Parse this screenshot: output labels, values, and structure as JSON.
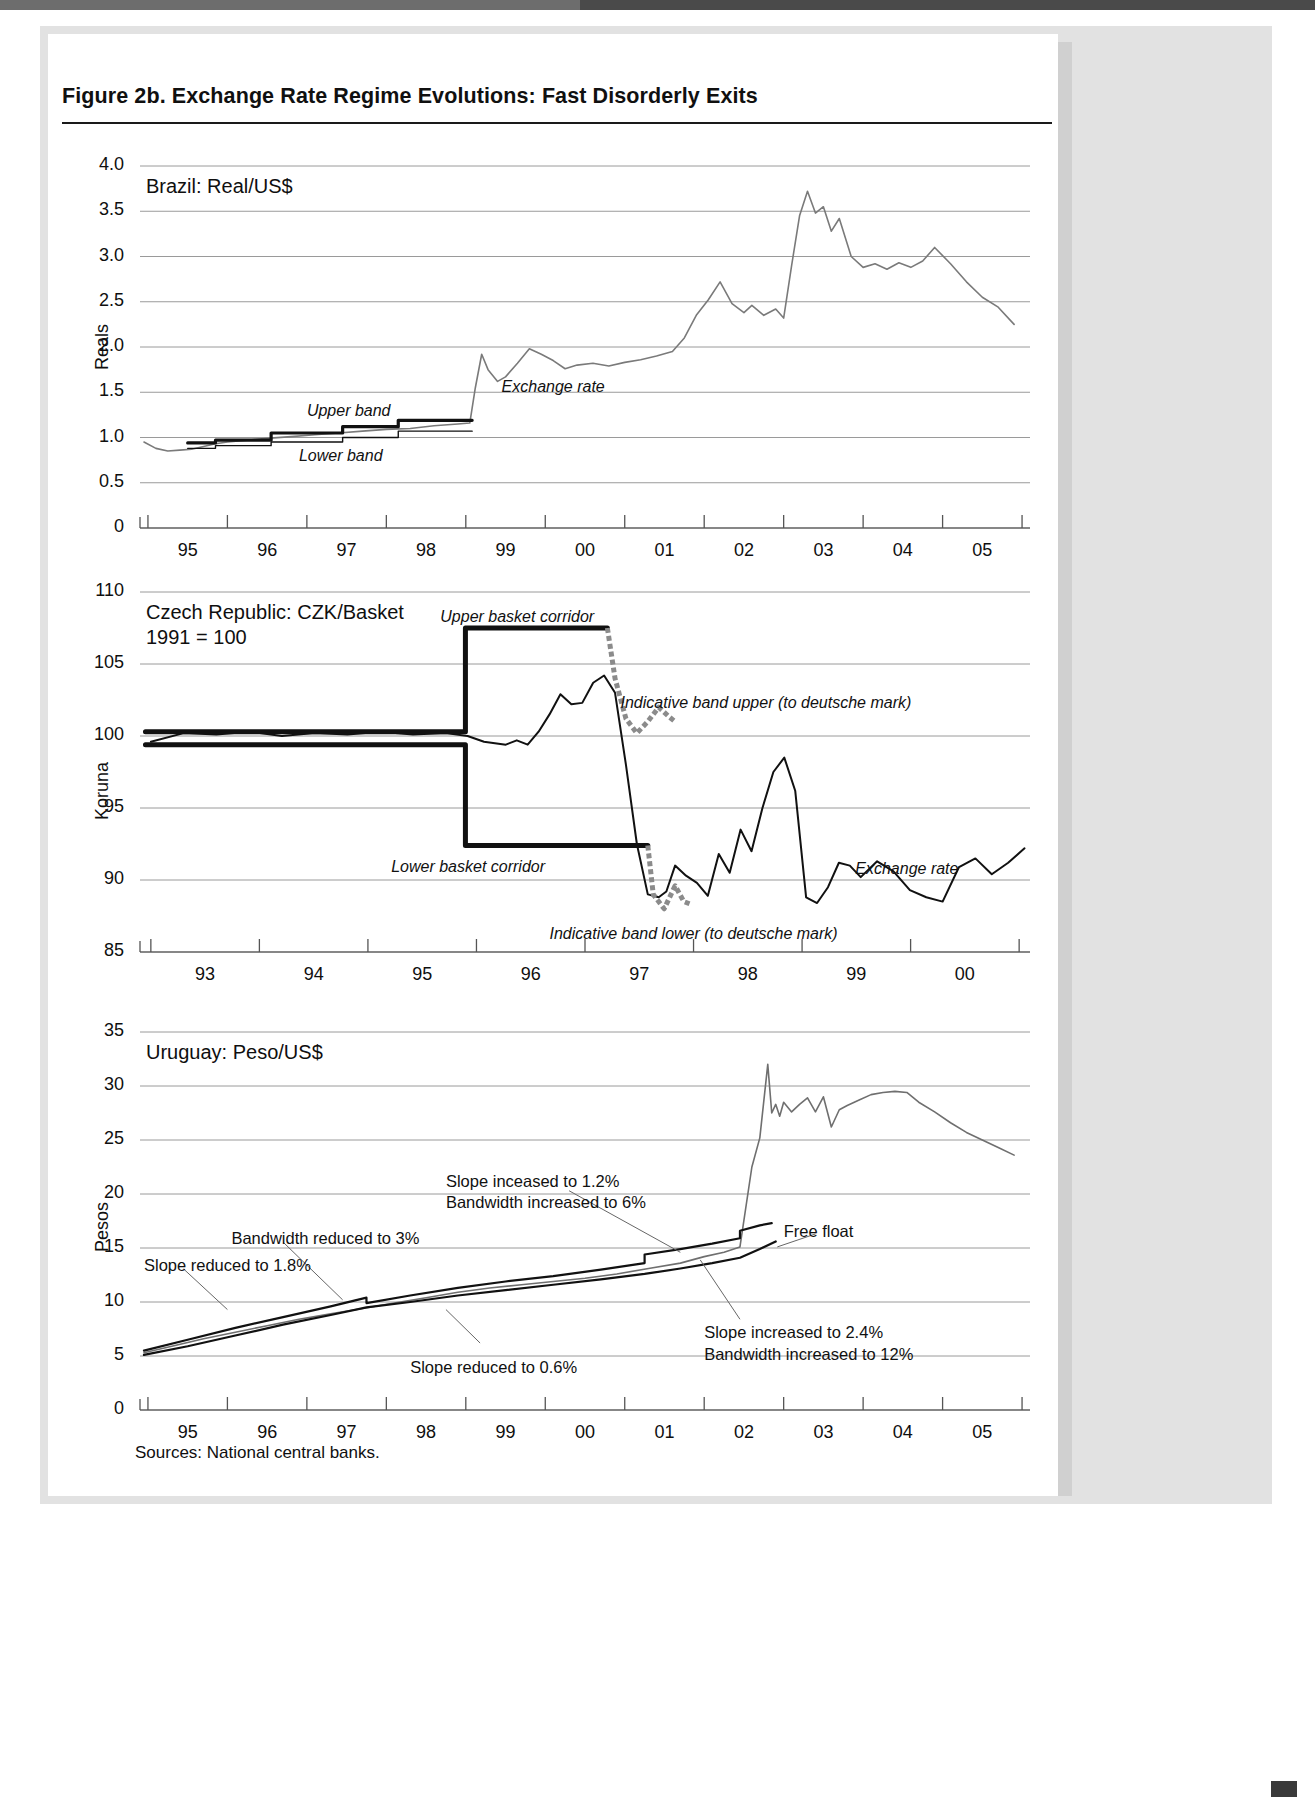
{
  "figure": {
    "title": "Figure 2b.  Exchange Rate Regime Evolutions: Fast Disorderly Exits",
    "sources": "Sources: National central banks."
  },
  "chart_data": [
    {
      "type": "line",
      "title": "Brazil: Real/US$",
      "ylabel": "Reals",
      "xlabel": "",
      "ylim": [
        0,
        4.0
      ],
      "yticks": [
        "0",
        "0.5",
        "1.0",
        "1.5",
        "2.0",
        "2.5",
        "3.0",
        "3.5",
        "4.0"
      ],
      "ytick_values": [
        0,
        0.5,
        1.0,
        1.5,
        2.0,
        2.5,
        3.0,
        3.5,
        4.0
      ],
      "xticks": [
        "95",
        "96",
        "97",
        "98",
        "99",
        "00",
        "01",
        "02",
        "03",
        "04",
        "05"
      ],
      "xlim": [
        1994.4,
        2005.6
      ],
      "grid": true,
      "annotations": [
        {
          "text": "Exchange rate",
          "x": 1998.95,
          "y": 1.55
        },
        {
          "text": "Upper band",
          "x": 1996.5,
          "y": 1.28
        },
        {
          "text": "Lower band",
          "x": 1996.4,
          "y": 0.78
        }
      ],
      "series": [
        {
          "name": "Exchange rate",
          "color": "#7a7a7a",
          "x": [
            1994.45,
            1994.6,
            1994.75,
            1994.9,
            1995.05,
            1995.2,
            1995.35,
            1995.5,
            1995.75,
            1996.0,
            1996.3,
            1996.6,
            1996.9,
            1997.2,
            1997.5,
            1997.8,
            1998.1,
            1998.4,
            1998.55,
            1998.62,
            1998.7,
            1998.78,
            1998.9,
            1999.0,
            1999.15,
            1999.3,
            1999.45,
            1999.6,
            1999.75,
            1999.9,
            2000.1,
            2000.3,
            2000.5,
            2000.7,
            2000.9,
            2001.1,
            2001.25,
            2001.4,
            2001.55,
            2001.7,
            2001.85,
            2002.0,
            2002.1,
            2002.25,
            2002.4,
            2002.5,
            2002.6,
            2002.7,
            2002.8,
            2002.9,
            2003.0,
            2003.1,
            2003.2,
            2003.35,
            2003.5,
            2003.65,
            2003.8,
            2003.95,
            2004.1,
            2004.25,
            2004.4,
            2004.6,
            2004.8,
            2005.0,
            2005.2,
            2005.4
          ],
          "y": [
            0.95,
            0.88,
            0.85,
            0.86,
            0.87,
            0.9,
            0.93,
            0.95,
            0.97,
            0.99,
            1.01,
            1.03,
            1.05,
            1.07,
            1.09,
            1.1,
            1.13,
            1.15,
            1.16,
            1.55,
            1.92,
            1.75,
            1.62,
            1.67,
            1.82,
            1.98,
            1.92,
            1.85,
            1.76,
            1.8,
            1.82,
            1.79,
            1.83,
            1.86,
            1.9,
            1.95,
            2.1,
            2.35,
            2.52,
            2.72,
            2.48,
            2.38,
            2.46,
            2.35,
            2.42,
            2.32,
            2.9,
            3.45,
            3.72,
            3.48,
            3.55,
            3.28,
            3.42,
            3.0,
            2.88,
            2.92,
            2.86,
            2.93,
            2.88,
            2.95,
            3.1,
            2.92,
            2.72,
            2.55,
            2.44,
            2.25
          ]
        },
        {
          "name": "Upper band",
          "color": "#111111",
          "width": 3.2,
          "x": [
            1995.0,
            1995.35,
            1995.35,
            1996.05,
            1996.05,
            1996.95,
            1996.95,
            1997.65,
            1997.65,
            1998.58
          ],
          "y": [
            0.94,
            0.94,
            0.97,
            0.97,
            1.05,
            1.05,
            1.12,
            1.12,
            1.19,
            1.19
          ]
        },
        {
          "name": "Lower band",
          "color": "#111111",
          "width": 1.4,
          "x": [
            1995.0,
            1995.35,
            1995.35,
            1996.05,
            1996.05,
            1996.95,
            1996.95,
            1997.65,
            1997.65,
            1998.58
          ],
          "y": [
            0.88,
            0.88,
            0.91,
            0.91,
            0.95,
            0.95,
            1.0,
            1.0,
            1.07,
            1.07
          ]
        }
      ]
    },
    {
      "type": "line",
      "title": "Czech Republic: CZK/Basket\n1991 = 100",
      "ylabel": "Koruna",
      "xlabel": "",
      "ylim": [
        85,
        110
      ],
      "yticks": [
        "85",
        "90",
        "95",
        "100",
        "105",
        "110"
      ],
      "ytick_values": [
        85,
        90,
        95,
        100,
        105,
        110
      ],
      "xticks": [
        "93",
        "94",
        "95",
        "96",
        "97",
        "98",
        "99",
        "00"
      ],
      "xlim": [
        1992.6,
        2000.75
      ],
      "grid": true,
      "annotations": [
        {
          "text": "Upper basket corridor",
          "x": 1995.35,
          "y": 108.2
        },
        {
          "text": "Lower basket corridor",
          "x": 1994.9,
          "y": 90.8
        },
        {
          "text": "Indicative band upper (to deutsche mark)",
          "x": 1997.0,
          "y": 102.2
        },
        {
          "text": "Indicative band lower (to deutsche mark)",
          "x": 1996.35,
          "y": 86.2
        },
        {
          "text": "Exchange rate",
          "x": 1999.15,
          "y": 90.7
        }
      ],
      "series": [
        {
          "name": "Exchange rate",
          "color": "#111111",
          "width": 2.0,
          "x": [
            1992.7,
            1993.0,
            1993.3,
            1993.6,
            1993.9,
            1994.2,
            1994.5,
            1994.8,
            1995.1,
            1995.4,
            1995.6,
            1995.75,
            1995.85,
            1995.95,
            1996.05,
            1996.15,
            1996.25,
            1996.35,
            1996.45,
            1996.55,
            1996.65,
            1996.75,
            1996.85,
            1996.95,
            1997.05,
            1997.15,
            1997.25,
            1997.35,
            1997.42,
            1997.5,
            1997.6,
            1997.7,
            1997.8,
            1997.9,
            1998.0,
            1998.1,
            1998.2,
            1998.3,
            1998.4,
            1998.5,
            1998.6,
            1998.7,
            1998.8,
            1998.9,
            1999.0,
            1999.1,
            1999.2,
            1999.35,
            1999.5,
            1999.65,
            1999.8,
            1999.95,
            2000.1,
            2000.25,
            2000.4,
            2000.55,
            2000.7
          ],
          "y": [
            99.6,
            100.2,
            100.1,
            100.3,
            100.0,
            100.2,
            100.1,
            100.3,
            100.1,
            100.2,
            100.0,
            99.6,
            99.5,
            99.4,
            99.7,
            99.4,
            100.3,
            101.5,
            102.9,
            102.2,
            102.3,
            103.7,
            104.2,
            103.0,
            98.0,
            92.5,
            89.0,
            88.8,
            89.2,
            91.0,
            90.3,
            89.8,
            88.9,
            91.8,
            90.5,
            93.5,
            92.0,
            95.0,
            97.5,
            98.5,
            96.2,
            88.8,
            88.4,
            89.5,
            91.2,
            91.0,
            90.2,
            91.3,
            90.6,
            89.3,
            88.8,
            88.5,
            90.9,
            91.5,
            90.4,
            91.2,
            92.2
          ]
        },
        {
          "name": "Upper basket corridor",
          "color": "#111111",
          "width": 5,
          "x": [
            1992.65,
            1995.58,
            1995.58,
            1996.88
          ],
          "y": [
            100.3,
            100.3,
            107.5,
            107.5
          ]
        },
        {
          "name": "Lower basket corridor",
          "color": "#111111",
          "width": 5,
          "x": [
            1992.65,
            1995.58,
            1995.58,
            1997.25
          ],
          "y": [
            99.4,
            99.4,
            92.4,
            92.4
          ]
        },
        {
          "name": "Indicative band upper (to deutsche mark)",
          "color": "#8b8b8b",
          "width": 5,
          "dashed": true,
          "x": [
            1996.88,
            1996.95,
            1997.05,
            1997.15,
            1997.25,
            1997.35,
            1997.45,
            1997.5
          ],
          "y": [
            107.5,
            104.0,
            101.2,
            100.2,
            101.0,
            102.0,
            101.3,
            101.0
          ]
        },
        {
          "name": "Indicative band lower (to deutsche mark)",
          "color": "#8b8b8b",
          "width": 5,
          "dashed": true,
          "x": [
            1997.25,
            1997.3,
            1997.4,
            1997.5,
            1997.58,
            1997.65
          ],
          "y": [
            92.4,
            89.0,
            88.0,
            89.6,
            88.5,
            88.3
          ]
        }
      ]
    },
    {
      "type": "line",
      "title": "Uruguay: Peso/US$",
      "ylabel": "Pesos",
      "xlabel": "",
      "ylim": [
        0,
        35
      ],
      "yticks": [
        "0",
        "5",
        "10",
        "15",
        "20",
        "25",
        "30",
        "35"
      ],
      "ytick_values": [
        0,
        5,
        10,
        15,
        20,
        25,
        30,
        35
      ],
      "xticks": [
        "95",
        "96",
        "97",
        "98",
        "99",
        "00",
        "01",
        "02",
        "03",
        "04",
        "05"
      ],
      "xlim": [
        1994.4,
        2005.6
      ],
      "grid": true,
      "annotations": [
        {
          "text": "Slope inceased to 1.2%\nBandwidth increased to 6%",
          "x": 1998.25,
          "y": 21.2
        },
        {
          "text": "Bandwidth reduced to 3%",
          "x": 1995.55,
          "y": 15.9
        },
        {
          "text": "Slope reduced to 1.8%",
          "x": 1994.45,
          "y": 13.4
        },
        {
          "text": "Slope reduced to 0.6%",
          "x": 1997.8,
          "y": 4.0
        },
        {
          "text": "Slope increased to 2.4%\nBandwidth increased to 12%",
          "x": 2001.5,
          "y": 7.2
        },
        {
          "text": "Free float",
          "x": 2002.5,
          "y": 16.6
        }
      ],
      "series": [
        {
          "name": "Exchange rate",
          "color": "#6f6f6f",
          "width": 1.6,
          "x": [
            1994.45,
            1994.8,
            1995.2,
            1995.6,
            1996.0,
            1996.4,
            1996.8,
            1997.2,
            1997.6,
            1998.0,
            1998.4,
            1998.8,
            1999.2,
            1999.6,
            2000.0,
            2000.4,
            2000.8,
            2001.2,
            2001.5,
            2001.75,
            2001.95,
            2002.1,
            2002.2,
            2002.3,
            2002.35,
            2002.4,
            2002.45,
            2002.5,
            2002.6,
            2002.7,
            2002.8,
            2002.9,
            2003.0,
            2003.1,
            2003.2,
            2003.3,
            2003.45,
            2003.6,
            2003.75,
            2003.9,
            2004.05,
            2004.2,
            2004.4,
            2004.6,
            2004.8,
            2005.0,
            2005.2,
            2005.4
          ],
          "y": [
            5.3,
            5.9,
            6.6,
            7.2,
            7.8,
            8.4,
            8.9,
            9.4,
            9.9,
            10.4,
            10.9,
            11.3,
            11.6,
            11.9,
            12.2,
            12.6,
            13.1,
            13.6,
            14.2,
            14.6,
            15.1,
            22.5,
            25.2,
            32.0,
            27.5,
            28.3,
            27.2,
            28.5,
            27.6,
            28.3,
            28.9,
            27.6,
            29.0,
            26.2,
            27.8,
            28.2,
            28.7,
            29.2,
            29.4,
            29.5,
            29.4,
            28.5,
            27.6,
            26.6,
            25.7,
            25.0,
            24.3,
            23.6
          ]
        },
        {
          "name": "Upper band",
          "color": "#111111",
          "width": 2.2,
          "x": [
            1994.45,
            1995.0,
            1995.6,
            1996.2,
            1996.8,
            1997.25,
            1997.25,
            1997.8,
            1998.4,
            1999.0,
            1999.6,
            2000.2,
            2000.75,
            2000.75,
            2001.2,
            2001.6,
            2001.95,
            2001.95,
            2002.2,
            2002.35
          ],
          "y": [
            5.5,
            6.5,
            7.6,
            8.6,
            9.6,
            10.4,
            9.9,
            10.6,
            11.3,
            11.9,
            12.4,
            13.0,
            13.6,
            14.4,
            14.9,
            15.4,
            15.9,
            16.6,
            17.1,
            17.3
          ]
        },
        {
          "name": "Lower band",
          "color": "#111111",
          "width": 2.2,
          "x": [
            1994.45,
            1995.0,
            1995.6,
            1996.2,
            1996.8,
            1997.25,
            1997.8,
            1998.4,
            1999.0,
            1999.6,
            2000.2,
            2000.75,
            2001.2,
            2001.6,
            2001.95,
            2002.2,
            2002.4
          ],
          "y": [
            5.1,
            5.9,
            6.9,
            7.9,
            8.8,
            9.5,
            10.0,
            10.6,
            11.1,
            11.6,
            12.1,
            12.6,
            13.1,
            13.6,
            14.1,
            14.9,
            15.6
          ]
        }
      ]
    }
  ]
}
